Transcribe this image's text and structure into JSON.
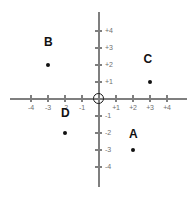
{
  "figure": {
    "origin_marker": "circle",
    "axis_color": "#7f7f7f",
    "point_color": "#111111",
    "label_color": "#6f6f6f"
  },
  "chart_data": {
    "type": "scatter",
    "title": "",
    "xlabel": "",
    "ylabel": "",
    "xlim": [
      -4.5,
      4.5
    ],
    "ylim": [
      -4.5,
      4.5
    ],
    "grid": false,
    "legend": "none",
    "x_ticks": [
      {
        "value": -4,
        "label": "-4"
      },
      {
        "value": -3,
        "label": "-3"
      },
      {
        "value": -2,
        "label": "-2"
      },
      {
        "value": -1,
        "label": "-1"
      },
      {
        "value": 1,
        "label": "+1"
      },
      {
        "value": 2,
        "label": "+2"
      },
      {
        "value": 3,
        "label": "+3"
      },
      {
        "value": 4,
        "label": "+4"
      }
    ],
    "y_ticks": [
      {
        "value": 4,
        "label": "+4"
      },
      {
        "value": 3,
        "label": "+3"
      },
      {
        "value": 2,
        "label": "+2"
      },
      {
        "value": 1,
        "label": "+1"
      },
      {
        "value": -1,
        "label": "-1"
      },
      {
        "value": -2,
        "label": "-2"
      },
      {
        "value": -3,
        "label": "-3"
      },
      {
        "value": -4,
        "label": "-4"
      }
    ],
    "points": [
      {
        "label": "A",
        "x": 2,
        "y": -3,
        "label_dx": 0,
        "label_dy": 0.6
      },
      {
        "label": "B",
        "x": -3,
        "y": 2,
        "label_dx": 0,
        "label_dy": 1.0
      },
      {
        "label": "C",
        "x": 3,
        "y": 1,
        "label_dx": -0.15,
        "label_dy": 1.0
      },
      {
        "label": "D",
        "x": -2,
        "y": -2,
        "label_dx": 0,
        "label_dy": 0.85
      }
    ]
  }
}
